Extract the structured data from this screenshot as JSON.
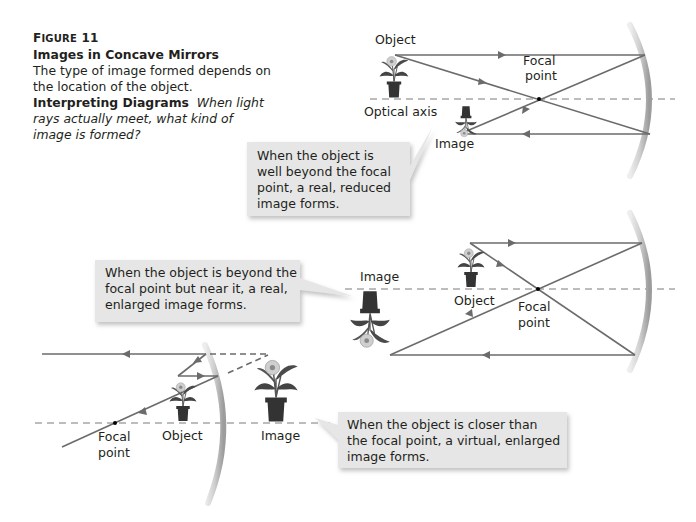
{
  "caption": {
    "figure_label_first": "F",
    "figure_label_rest": "IGURE",
    "figure_number": "11",
    "title": "Images in Concave Mirrors",
    "description": "The type of image formed depends on the location of the object.",
    "lead": "Interpreting Diagrams",
    "question": "When light rays actually meet, what kind of image is formed?"
  },
  "colors": {
    "ray": "#6b6b6b",
    "axis": "#7a7a7a",
    "mirror": "#c9c9c9",
    "mirror_edge": "#9a9a9a",
    "callout_bg": "#e6e6e6",
    "callout_shadow": "#c8c8c8",
    "pot": "#333333",
    "leaf": "#4a4a4a"
  },
  "panels": [
    {
      "id": "far",
      "labels": {
        "object": "Object",
        "focal_1": "Focal",
        "focal_2": "point",
        "axis": "Optical axis",
        "image": "Image"
      },
      "callout": [
        "When the object is",
        "well beyond the focal",
        "point, a real, reduced",
        "image forms."
      ]
    },
    {
      "id": "near",
      "labels": {
        "image": "Image",
        "object": "Object",
        "focal_1": "Focal",
        "focal_2": "point"
      },
      "callout": [
        "When the object is beyond the",
        "focal point but near it, a real,",
        "enlarged image forms."
      ]
    },
    {
      "id": "inside",
      "labels": {
        "focal_1": "Focal",
        "focal_2": "point",
        "object": "Object",
        "image": "Image"
      },
      "callout": [
        "When the object is closer than",
        "the focal point, a virtual, enlarged",
        "image forms."
      ]
    }
  ]
}
